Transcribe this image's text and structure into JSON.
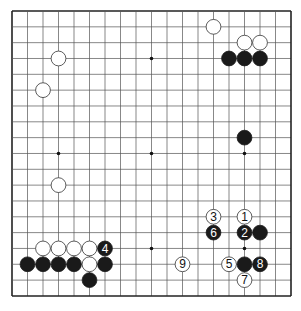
{
  "board": {
    "size": 19,
    "left": 12,
    "top": 11,
    "dx": 15.5,
    "dy": 15.83,
    "line_color": "#555555",
    "border_color": "#222222",
    "hoshi": [
      [
        3,
        3
      ],
      [
        9,
        3
      ],
      [
        15,
        3
      ],
      [
        3,
        9
      ],
      [
        9,
        9
      ],
      [
        15,
        9
      ],
      [
        3,
        15
      ],
      [
        9,
        15
      ],
      [
        15,
        15
      ]
    ]
  },
  "stones": [
    {
      "color": "white",
      "col": 3,
      "row": 3
    },
    {
      "color": "white",
      "col": 2,
      "row": 5
    },
    {
      "color": "white",
      "col": 13,
      "row": 1
    },
    {
      "color": "white",
      "col": 15,
      "row": 2
    },
    {
      "color": "white",
      "col": 16,
      "row": 2
    },
    {
      "color": "black",
      "col": 14,
      "row": 3
    },
    {
      "color": "black",
      "col": 15,
      "row": 3
    },
    {
      "color": "black",
      "col": 16,
      "row": 3
    },
    {
      "color": "black",
      "col": 15,
      "row": 8
    },
    {
      "color": "white",
      "col": 3,
      "row": 11
    },
    {
      "color": "white",
      "col": 2,
      "row": 15
    },
    {
      "color": "white",
      "col": 3,
      "row": 15
    },
    {
      "color": "white",
      "col": 4,
      "row": 15
    },
    {
      "color": "white",
      "col": 5,
      "row": 15
    },
    {
      "color": "black",
      "col": 6,
      "row": 15,
      "label": "4"
    },
    {
      "color": "black",
      "col": 1,
      "row": 16
    },
    {
      "color": "black",
      "col": 2,
      "row": 16
    },
    {
      "color": "black",
      "col": 3,
      "row": 16
    },
    {
      "color": "black",
      "col": 4,
      "row": 16
    },
    {
      "color": "white",
      "col": 5,
      "row": 16
    },
    {
      "color": "black",
      "col": 6,
      "row": 16
    },
    {
      "color": "black",
      "col": 5,
      "row": 17
    },
    {
      "color": "white",
      "col": 13,
      "row": 13,
      "label": "3"
    },
    {
      "color": "white",
      "col": 15,
      "row": 13,
      "label": "1"
    },
    {
      "color": "black",
      "col": 13,
      "row": 14,
      "label": "6"
    },
    {
      "color": "black",
      "col": 15,
      "row": 14,
      "label": "2"
    },
    {
      "color": "black",
      "col": 16,
      "row": 14
    },
    {
      "color": "white",
      "col": 11,
      "row": 16,
      "label": "9"
    },
    {
      "color": "white",
      "col": 14,
      "row": 16,
      "label": "5"
    },
    {
      "color": "black",
      "col": 15,
      "row": 16
    },
    {
      "color": "black",
      "col": 16,
      "row": 16,
      "label": "8"
    },
    {
      "color": "white",
      "col": 15,
      "row": 17,
      "label": "7"
    }
  ]
}
